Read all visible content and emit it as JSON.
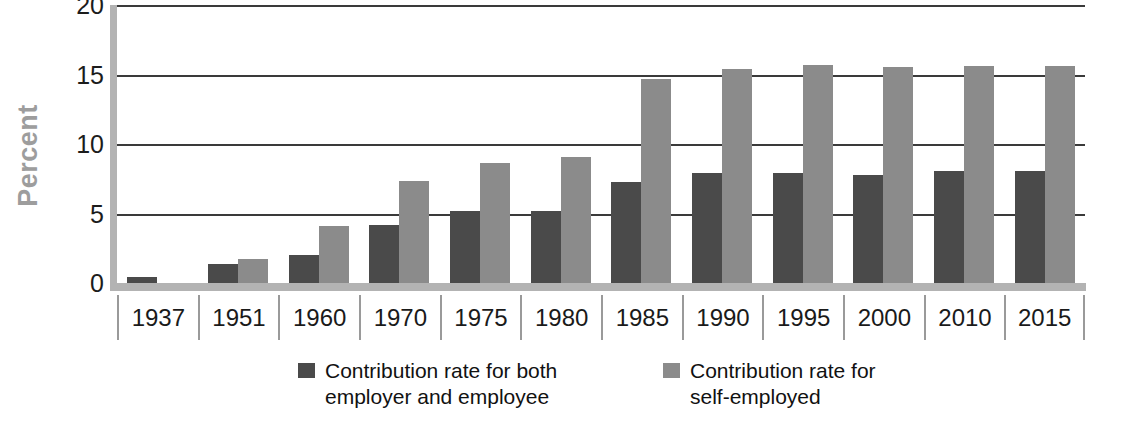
{
  "chart_data": {
    "type": "bar",
    "title": "",
    "xlabel": "",
    "ylabel": "Percent",
    "ylim": [
      0,
      20
    ],
    "yticks": [
      0,
      5,
      10,
      15,
      20
    ],
    "ytick_labels": [
      "0",
      "5",
      "10",
      "15",
      "20"
    ],
    "grid": true,
    "legend_position": "bottom",
    "categories": [
      "1937",
      "1951",
      "1960",
      "1970",
      "1975",
      "1980",
      "1985",
      "1990",
      "1995",
      "2000",
      "2010",
      "2015"
    ],
    "series": [
      {
        "name": "Contribution rate for both employer and employee",
        "name_line1": "Contribution rate for both",
        "name_line2": "employer and employee",
        "color": "#4a4a4a",
        "values": [
          0.4,
          1.4,
          2.0,
          4.2,
          5.15,
          5.15,
          7.3,
          7.9,
          7.9,
          7.8,
          8.05,
          8.05
        ]
      },
      {
        "name": "Contribution rate for self-employed",
        "name_line1": "Contribution rate for",
        "name_line2": "self-employed",
        "color": "#8b8b8b",
        "values": [
          0,
          1.7,
          4.1,
          7.35,
          8.65,
          9.1,
          14.7,
          15.4,
          15.7,
          15.55,
          15.6,
          15.6
        ]
      }
    ]
  },
  "axis": {
    "y_title": "Percent",
    "y_title_color": "#9d9d9d",
    "axis_color": "#b3b3b3",
    "gridline_color": "#3a3a3a"
  }
}
